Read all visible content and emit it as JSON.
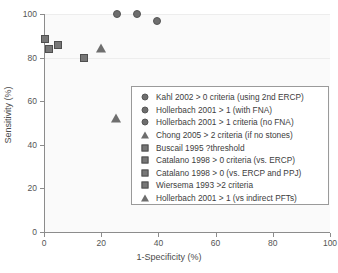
{
  "chart_data": {
    "type": "scatter",
    "title": "",
    "xlabel": "1-Specificity (%)",
    "ylabel": "Sensitivity (%)",
    "xlim": [
      0,
      100
    ],
    "ylim": [
      0,
      100
    ],
    "xticks": [
      0,
      20,
      40,
      60,
      80,
      100
    ],
    "yticks": [
      0,
      20,
      40,
      60,
      80,
      100
    ],
    "xticklabels": [
      "0",
      "20",
      "40",
      "60",
      "80",
      "100"
    ],
    "yticklabels": [
      "0",
      "20",
      "40",
      "60",
      "80",
      "100"
    ],
    "grid": "horizontal-faint",
    "legend_position": "center-right",
    "series": [
      {
        "name": "Kahl 2002 > 0 criteria (using 2nd ERCP)",
        "marker": "circle",
        "color": "#6e6e6e",
        "points": [
          {
            "x": 25.5,
            "y": 100
          }
        ]
      },
      {
        "name": "Hollerbach 2001 > 1 (with FNA)",
        "marker": "circle",
        "color": "#6e6e6e",
        "points": [
          {
            "x": 32.5,
            "y": 100
          }
        ]
      },
      {
        "name": "Hollerbach 2001 > 1 criteria (no FNA)",
        "marker": "circle",
        "color": "#6e6e6e",
        "points": [
          {
            "x": 39.5,
            "y": 97
          }
        ]
      },
      {
        "name": "Chong 2005 > 2 criteria (if no stones)",
        "marker": "triangle",
        "color": "#6e6e6e",
        "points": [
          {
            "x": 20,
            "y": 84.5
          }
        ]
      },
      {
        "name": "Buscail 1995 ?threshold",
        "marker": "square",
        "color": "#777777",
        "points": [
          {
            "x": 0.3,
            "y": 88.5
          }
        ]
      },
      {
        "name": "Catalano 1998 > 0 criteria (vs. ERCP)",
        "marker": "square",
        "color": "#777777",
        "points": [
          {
            "x": 1.8,
            "y": 84
          }
        ]
      },
      {
        "name": "Catalano 1998 > 0 (vs. ERCP and PPJ)",
        "marker": "square",
        "color": "#777777",
        "points": [
          {
            "x": 4.8,
            "y": 86
          }
        ]
      },
      {
        "name": "Wiersema 1993 >2 criteria",
        "marker": "square",
        "color": "#777777",
        "points": [
          {
            "x": 14,
            "y": 80
          }
        ]
      },
      {
        "name": "Hollerbach 2001 > 1 (vs indirect PFTs)",
        "marker": "triangle",
        "color": "#6e6e6e",
        "points": [
          {
            "x": 25,
            "y": 52.5
          }
        ]
      }
    ]
  }
}
